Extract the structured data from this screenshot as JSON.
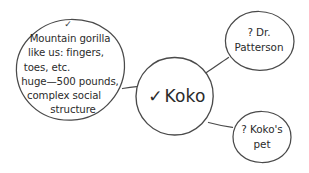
{
  "diagram": {
    "type": "mind-map",
    "style": "hand-drawn",
    "background_color": "#ffffff",
    "stroke_color": "#4a4a4a",
    "text_color": "#2b2b2b",
    "center": {
      "marker": "✓",
      "label": "Koko",
      "full_text": "✓ Koko"
    },
    "branches": [
      {
        "id": "mountain-gorilla",
        "position": "left",
        "marker": "✓",
        "lines": [
          "Mountain gorilla",
          "like us: fingers,",
          "toes, etc.",
          "huge—500 pounds,",
          "complex social",
          "structure"
        ]
      },
      {
        "id": "dr-patterson",
        "position": "top-right",
        "marker": "?",
        "lines": [
          "? Dr.",
          "Patterson"
        ]
      },
      {
        "id": "kokos-pet",
        "position": "bottom-right",
        "marker": "?",
        "lines": [
          "? Koko's",
          "pet"
        ]
      }
    ]
  }
}
